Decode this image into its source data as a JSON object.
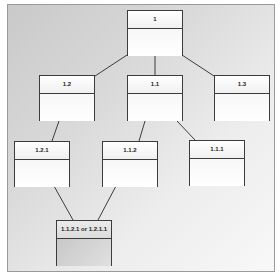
{
  "diagram": {
    "type": "hierarchy",
    "background": {
      "from": "#c9c9c9",
      "to": "#f8f8f8"
    },
    "border_color": "#3c3c3c",
    "nodes": [
      {
        "id": "1",
        "label": "1"
      },
      {
        "id": "1.2",
        "label": "1.2"
      },
      {
        "id": "1.1",
        "label": "1.1"
      },
      {
        "id": "1.3",
        "label": "1.3"
      },
      {
        "id": "1.2.1",
        "label": "1.2.1"
      },
      {
        "id": "1.1.2",
        "label": "1.1.2"
      },
      {
        "id": "1.1.1",
        "label": "1.1.1"
      },
      {
        "id": "merge",
        "label": "1.1.2.1 or 1.2.1.1"
      }
    ],
    "edges": [
      [
        "1",
        "1.2"
      ],
      [
        "1",
        "1.1"
      ],
      [
        "1",
        "1.3"
      ],
      [
        "1.2",
        "1.2.1"
      ],
      [
        "1.1",
        "1.1.2"
      ],
      [
        "1.1",
        "1.1.1"
      ],
      [
        "1.2.1",
        "merge"
      ],
      [
        "1.1.2",
        "merge"
      ]
    ]
  }
}
